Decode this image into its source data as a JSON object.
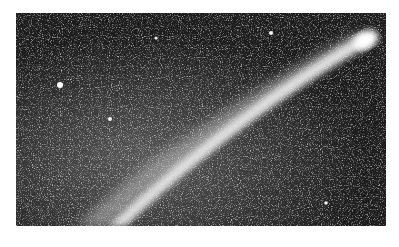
{
  "image": {
    "subject": "comet",
    "description": "Grayscale photograph of a comet with a long bright tail crossing a dense star field",
    "colors": {
      "background": "#ffffff",
      "sky": "#1a1a1a",
      "tail": "#f2f2f2",
      "stars": "#d9d9d9"
    }
  }
}
